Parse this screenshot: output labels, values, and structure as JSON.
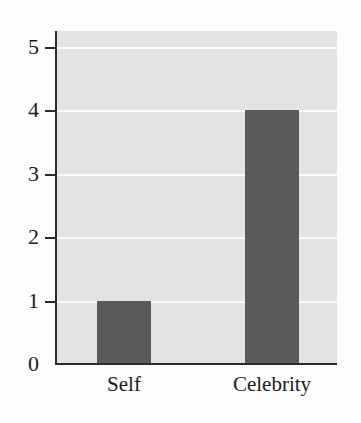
{
  "chart_data": {
    "type": "bar",
    "title": "",
    "subtitle": "",
    "xlabel": "",
    "ylabel": "",
    "categories": [
      "Self",
      "Celebrity"
    ],
    "values": [
      1,
      4
    ],
    "series": [
      {
        "name": "count",
        "values": [
          1,
          4
        ]
      }
    ],
    "ylim": [
      0,
      5
    ],
    "yticks": [
      0,
      1,
      2,
      3,
      4,
      5
    ],
    "ytick_labels": [
      "0",
      "1",
      "2",
      "3",
      "4",
      "5"
    ],
    "grid": true,
    "grid_axis": "y",
    "grid_color": "#fafafa",
    "legend": false,
    "legend_position": "none",
    "bar_color": "#5a5a5a",
    "plot_background": "#e3e3e3",
    "figure_background": "#fdfdfd",
    "axis_color": "#2b2b2b",
    "text_color": "#1c1c1c"
  },
  "axes": {
    "y": {
      "ticks": [
        {
          "label": "5",
          "value": 5
        },
        {
          "label": "4",
          "value": 4
        },
        {
          "label": "3",
          "value": 3
        },
        {
          "label": "2",
          "value": 2
        },
        {
          "label": "1",
          "value": 1
        },
        {
          "label": "0",
          "value": 0
        }
      ]
    },
    "x": {
      "ticks": [
        {
          "label": "Self"
        },
        {
          "label": "Celebrity"
        }
      ]
    }
  }
}
